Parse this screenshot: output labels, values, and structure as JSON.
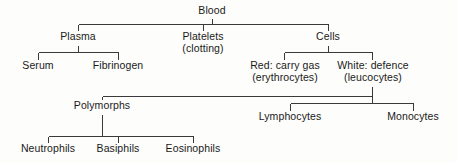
{
  "diagram": {
    "type": "tree",
    "title": "Blood",
    "background_color": "#fdfdfb",
    "line_color": "#3a3a3a",
    "text_color": "#1a1a1a",
    "nodes": [
      {
        "id": "blood",
        "label": "Blood",
        "sublabel": "",
        "x": 212,
        "y": 5,
        "level": 0
      },
      {
        "id": "plasma",
        "label": "Plasma",
        "sublabel": "",
        "x": 78,
        "y": 31,
        "level": 1
      },
      {
        "id": "platelets",
        "label": "Platelets",
        "sublabel": "(clotting)",
        "x": 203,
        "y": 31,
        "level": 1
      },
      {
        "id": "cells",
        "label": "Cells",
        "sublabel": "",
        "x": 328,
        "y": 31,
        "level": 1
      },
      {
        "id": "serum",
        "label": "Serum",
        "sublabel": "",
        "x": 38,
        "y": 60,
        "level": 2
      },
      {
        "id": "fibrinogen",
        "label": "Fibrinogen",
        "sublabel": "",
        "x": 118,
        "y": 60,
        "level": 2
      },
      {
        "id": "red-cells",
        "label": "Red: carry gas",
        "sublabel": "(erythrocytes)",
        "x": 285,
        "y": 60,
        "level": 2
      },
      {
        "id": "white-cells",
        "label": "White: defence",
        "sublabel": "(leucocytes)",
        "x": 373,
        "y": 60,
        "level": 2
      },
      {
        "id": "polymorphs",
        "label": "Polymorphs",
        "sublabel": "",
        "x": 102,
        "y": 100,
        "level": 3
      },
      {
        "id": "lymphocytes",
        "label": "Lymphocytes",
        "sublabel": "",
        "x": 290,
        "y": 111,
        "level": 3
      },
      {
        "id": "monocytes",
        "label": "Monocytes",
        "sublabel": "",
        "x": 413,
        "y": 111,
        "level": 3
      },
      {
        "id": "neutrophils",
        "label": "Neutrophils",
        "sublabel": "",
        "x": 48,
        "y": 143,
        "level": 4
      },
      {
        "id": "basiphils",
        "label": "Basiphils",
        "sublabel": "",
        "x": 118,
        "y": 143,
        "level": 4
      },
      {
        "id": "eosinophils",
        "label": "Eosinophils",
        "sublabel": "",
        "x": 193,
        "y": 143,
        "level": 4
      }
    ],
    "edges": [
      {
        "parent": "blood",
        "children": [
          "plasma",
          "platelets",
          "cells"
        ]
      },
      {
        "parent": "plasma",
        "children": [
          "serum",
          "fibrinogen"
        ]
      },
      {
        "parent": "cells",
        "children": [
          "red-cells",
          "white-cells"
        ]
      },
      {
        "parent": "white-cells",
        "children": [
          "polymorphs",
          "lymphocytes",
          "monocytes"
        ]
      },
      {
        "parent": "polymorphs",
        "children": [
          "neutrophils",
          "basiphils",
          "eosinophils"
        ]
      }
    ]
  }
}
